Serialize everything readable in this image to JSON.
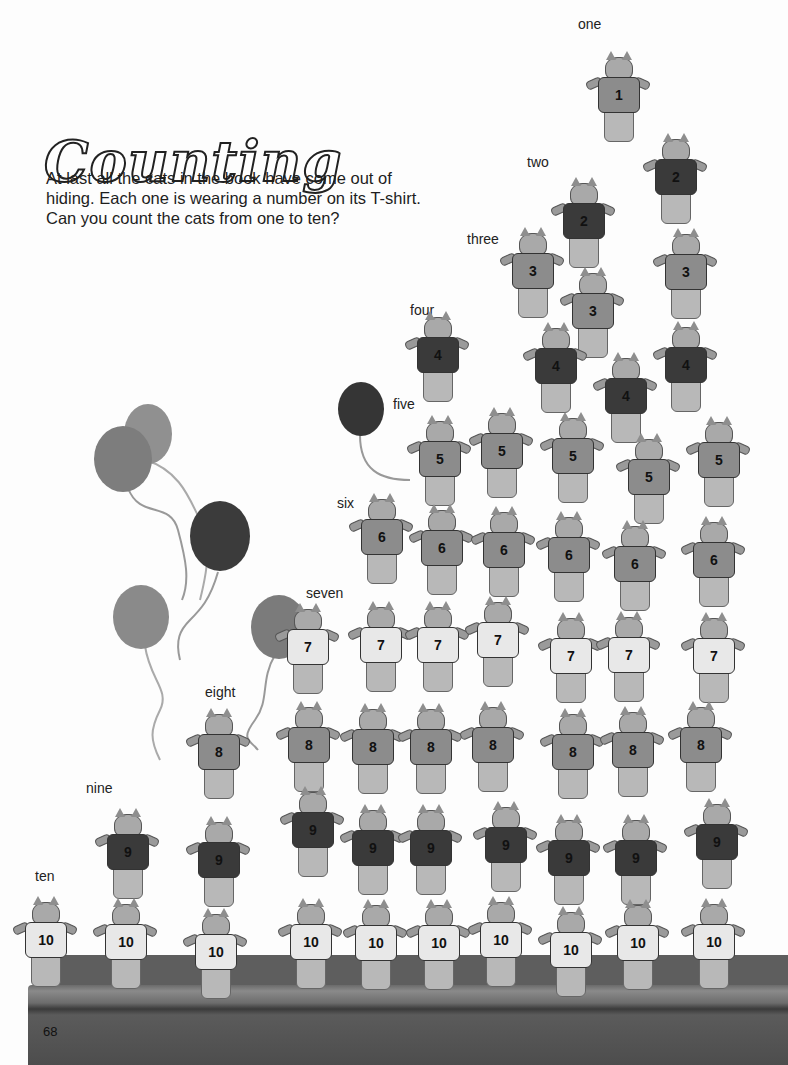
{
  "page": {
    "title": "Counting",
    "intro": "At last all the cats in the book have come out of hiding. Each one is wearing a number on its T-shirt. Can you count the cats from one to ten?",
    "page_number": "68"
  },
  "number_words": [
    "one",
    "two",
    "three",
    "four",
    "five",
    "six",
    "seven",
    "eight",
    "nine",
    "ten"
  ],
  "cat_counts": {
    "1": 1,
    "2": 2,
    "3": 3,
    "4": 4,
    "5": 5,
    "6": 6,
    "7": 7,
    "8": 8,
    "9": 9,
    "10": 10
  },
  "balloon_count": 6,
  "colors": {
    "shirt_light": "#e8e8e8",
    "shirt_mid": "#8c8c8c",
    "shirt_dark": "#3a3a3a",
    "balloon_dark": "#3b3b3b",
    "balloon_mid": "#8a8a8a",
    "stage": "#5a5a5a"
  }
}
